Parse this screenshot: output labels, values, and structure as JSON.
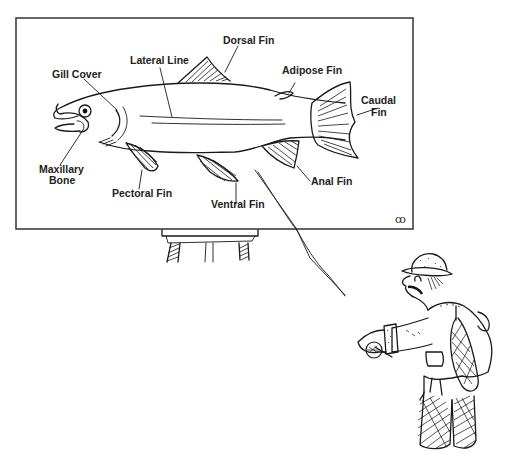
{
  "scene": {
    "description": "Cartoon of an angler pointing a fishing rod at a fish anatomy chart on an easel",
    "colors": {
      "ink": "#1a1a1a",
      "background": "#ffffff",
      "board_border": "#333333"
    }
  },
  "board": {
    "title": "",
    "labels": {
      "gill_cover": "Gill Cover",
      "lateral_line": "Lateral Line",
      "dorsal_fin": "Dorsal Fin",
      "adipose_fin": "Adipose Fin",
      "caudal_fin_line1": "Caudal",
      "caudal_fin_line2": "Fin",
      "maxillary_line1": "Maxillary",
      "maxillary_line2": "Bone",
      "pectoral_fin": "Pectoral Fin",
      "ventral_fin": "Ventral Fin",
      "anal_fin": "Anal Fin"
    },
    "signature": "ꝏ"
  }
}
